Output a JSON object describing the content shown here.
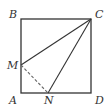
{
  "diagram": {
    "type": "geometry",
    "shape": "square",
    "points": {
      "A": {
        "label": "A",
        "x": 21,
        "y": 93
      },
      "B": {
        "label": "B",
        "x": 21,
        "y": 19
      },
      "C": {
        "label": "C",
        "x": 91,
        "y": 19
      },
      "D": {
        "label": "D",
        "x": 91,
        "y": 93
      },
      "M": {
        "label": "M",
        "x": 21,
        "y": 65
      },
      "N": {
        "label": "N",
        "x": 48,
        "y": 93
      }
    },
    "segments": [
      {
        "from": "A",
        "to": "B",
        "style": "solid"
      },
      {
        "from": "B",
        "to": "C",
        "style": "solid"
      },
      {
        "from": "C",
        "to": "D",
        "style": "solid"
      },
      {
        "from": "D",
        "to": "A",
        "style": "solid"
      },
      {
        "from": "C",
        "to": "M",
        "style": "solid"
      },
      {
        "from": "C",
        "to": "N",
        "style": "solid"
      },
      {
        "from": "M",
        "to": "N",
        "style": "dashed"
      }
    ],
    "colors": {
      "stroke": "#333333",
      "background": "#ffffff"
    }
  }
}
